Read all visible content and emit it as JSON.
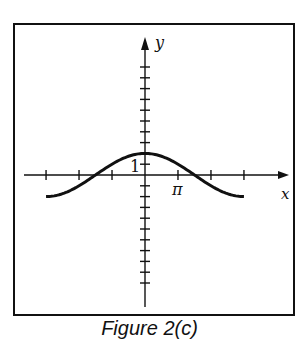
{
  "caption": "Figure 2(c)",
  "chart_data": {
    "type": "line",
    "title": "",
    "xlabel": "x",
    "ylabel": "y",
    "function": "y = 2cos(x/3)",
    "x_tick_labels": [
      "π"
    ],
    "y_tick_labels": [
      "1"
    ],
    "x_ticks": [
      -9.42,
      -6.28,
      -3.14,
      3.14,
      6.28,
      9.42
    ],
    "y_ticks": [
      -10,
      -9,
      -8,
      -7,
      -6,
      -5,
      -4,
      -3,
      -2,
      -1,
      1,
      2,
      3,
      4,
      5,
      6,
      7,
      8,
      9,
      10
    ],
    "xlim": [
      -3.7,
      4.3
    ],
    "ylim": [
      -11,
      11
    ],
    "x_domain": [
      -9.42,
      9.42
    ],
    "series": [
      {
        "name": "curve",
        "x": [
          -9.42,
          -7.07,
          -4.71,
          -2.36,
          0,
          2.36,
          4.71,
          7.07,
          9.42
        ],
        "y": [
          -2,
          -1.41,
          0,
          1.41,
          2,
          1.41,
          0,
          -1.41,
          -2
        ]
      }
    ],
    "grid": false,
    "legend": "none"
  },
  "colors": {
    "ink": "#111111",
    "background": "#ffffff"
  }
}
